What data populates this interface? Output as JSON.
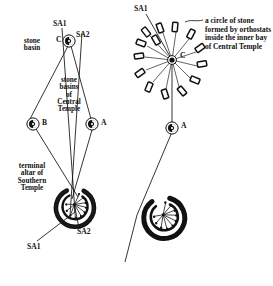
{
  "figure": {
    "background_color": "#ffffff",
    "ink_color": "#111111",
    "width": 273,
    "height": 286
  },
  "left_panel": {
    "name": "alignment-plan-left",
    "labels": {
      "sa1_top": "SA1",
      "sa2_top": "SA2",
      "point_c": "C",
      "stone_basin": "stone\nbasin",
      "point_b": "B",
      "point_a": "A",
      "stone_basins_central_temple": "stone\nbasins\nof\nCentral\nTemple",
      "terminal_altar": "terminal\naltar of\nSouthern\nTemple",
      "sa2_bottom": "SA2",
      "sa1_bottom": "SA1"
    },
    "nodes": [
      {
        "id": "C",
        "label": "C",
        "x": 69,
        "y": 41,
        "type": "stone-basin-marker"
      },
      {
        "id": "B",
        "label": "B",
        "x": 33,
        "y": 124,
        "type": "stone-basin-marker"
      },
      {
        "id": "A",
        "label": "A",
        "x": 92,
        "y": 124,
        "type": "stone-basin-marker"
      }
    ],
    "sightlines": [
      {
        "from": "SA1-top",
        "to": "terminal-altar",
        "name": "sightline-sa1"
      },
      {
        "from": "SA2-top",
        "to": "terminal-altar",
        "name": "sightline-sa2"
      }
    ]
  },
  "right_panel": {
    "name": "alignment-plan-right",
    "labels": {
      "sa1_top": "SA1",
      "point_c": "C",
      "point_a": "A",
      "annotation": "a circle of stone\nformed by orthostats\ninside the inner bay\nof Central Temple"
    },
    "nodes": [
      {
        "id": "C",
        "label": "C",
        "x": 172,
        "y": 60,
        "type": "orthostat-circle-centre"
      },
      {
        "id": "A",
        "label": "A",
        "x": 172,
        "y": 128,
        "type": "stone-basin-marker"
      }
    ],
    "orthostat_count": 14
  }
}
